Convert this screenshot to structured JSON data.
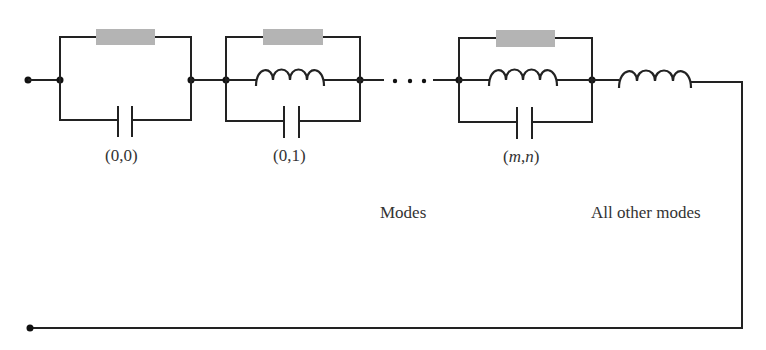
{
  "diagram": {
    "type": "equivalent-circuit",
    "colors": {
      "wire": "#222222",
      "resistor_fill": "#b4b4b4",
      "text": "#333333",
      "background": "#ffffff"
    },
    "stages": [
      {
        "id": "stage-0-0",
        "label": "(0,0)",
        "elements": [
          "resistor",
          "capacitor"
        ]
      },
      {
        "id": "stage-0-1",
        "label": "(0,1)",
        "elements": [
          "resistor",
          "inductor",
          "capacitor"
        ]
      },
      {
        "id": "stage-m-n",
        "label_parts": [
          "(",
          "m",
          ",",
          "n",
          ")"
        ],
        "label": "(m,n)",
        "elements": [
          "resistor",
          "inductor",
          "capacitor"
        ]
      }
    ],
    "ellipsis": "···",
    "series_element": "inductor",
    "captions": {
      "modes": "Modes",
      "all_other_modes": "All other modes"
    },
    "terminals": [
      "top-left-terminal",
      "bottom-left-terminal"
    ]
  }
}
